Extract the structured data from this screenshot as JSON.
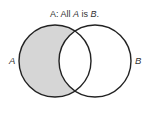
{
  "diagram": {
    "type": "venn",
    "title": {
      "prefix": "A:",
      "text_parts": [
        "All ",
        "A",
        " is ",
        "B",
        "."
      ],
      "full": "A: All A is B."
    },
    "sets": [
      {
        "id": "A",
        "label": "A",
        "cx": 55,
        "cy": 61,
        "r": 36
      },
      {
        "id": "B",
        "label": "B",
        "cx": 95,
        "cy": 61,
        "r": 36
      }
    ],
    "shaded_region": "A minus B",
    "colors": {
      "shade": "#d6d6d6",
      "stroke": "#222222",
      "text": "#333333",
      "background": "#ffffff"
    }
  }
}
